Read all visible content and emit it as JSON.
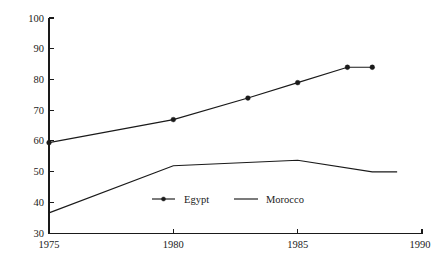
{
  "chart_data": {
    "type": "line",
    "title": "",
    "subtitle": "",
    "xlabel": "",
    "ylabel": "",
    "xlim": [
      1975,
      1990
    ],
    "ylim": [
      30,
      100
    ],
    "grid": false,
    "legend_position": "inside-center-bottom",
    "x_ticks": [
      1975,
      1980,
      1985,
      1990
    ],
    "x_tick_labels": [
      "1975",
      "1980",
      "1985",
      "1990"
    ],
    "y_ticks": [
      30,
      40,
      50,
      60,
      70,
      80,
      90,
      100
    ],
    "y_tick_labels": [
      "30",
      "40",
      "50",
      "60",
      "70",
      "80",
      "90",
      "100"
    ],
    "series": [
      {
        "name": "Egypt",
        "marker": "filled-circle",
        "color": "#1a1a1a",
        "x": [
          1975,
          1980,
          1983,
          1985,
          1987,
          1988
        ],
        "values": [
          59.5,
          67,
          74,
          79,
          84,
          84
        ]
      },
      {
        "name": "Morocco",
        "marker": "none",
        "color": "#1a1a1a",
        "x": [
          1975,
          1980,
          1985,
          1988,
          1989
        ],
        "values": [
          36.7,
          52,
          53.8,
          50,
          50
        ]
      }
    ],
    "legend": [
      {
        "label": "Egypt",
        "marker": "filled-circle"
      },
      {
        "label": "Morocco",
        "marker": "none"
      }
    ]
  },
  "axis": {
    "y_tick_0": "100",
    "y_tick_1": "90",
    "y_tick_2": "80",
    "y_tick_3": "70",
    "y_tick_4": "60",
    "y_tick_5": "50",
    "y_tick_6": "40",
    "y_tick_7": "30",
    "x_tick_0": "1975",
    "x_tick_1": "1980",
    "x_tick_2": "1985",
    "x_tick_3": "1990"
  },
  "legend": {
    "egypt_label": "Egypt",
    "morocco_label": "Morocco"
  }
}
